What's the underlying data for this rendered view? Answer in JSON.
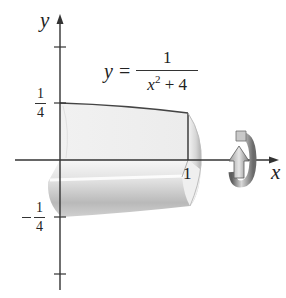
{
  "figure": {
    "type": "solid-of-revolution",
    "equation": {
      "lhs": "y",
      "equals": "=",
      "numerator": "1",
      "denominator_var": "x",
      "denominator_exp": "2",
      "denominator_rest": " + 4"
    },
    "axes": {
      "x_label": "x",
      "y_label": "y"
    },
    "ticks": {
      "y_pos": {
        "numerator": "1",
        "denominator": "4"
      },
      "y_neg": {
        "sign": "−",
        "numerator": "1",
        "denominator": "4"
      },
      "x_one": "1"
    },
    "icons": {
      "rotation": "rotation-arrow-icon"
    },
    "colors": {
      "axis": "#333333",
      "curve": "#444444",
      "solid_light": "#f0f0f0",
      "solid_mid": "#d8d8d8",
      "solid_dark": "#a9a9a9",
      "arrow_light": "#d9d9d9",
      "arrow_dark": "#6e6e6e"
    }
  }
}
